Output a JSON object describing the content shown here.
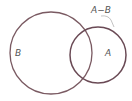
{
  "diagram": {
    "type": "venn",
    "sets": [
      {
        "name": "B",
        "label": "B"
      },
      {
        "name": "A",
        "label": "A"
      }
    ],
    "region_callout": {
      "label": "A−B"
    },
    "colors": {
      "stroke": "#7a5a62",
      "label": "#555555",
      "leader": "#9a9a9a"
    }
  }
}
